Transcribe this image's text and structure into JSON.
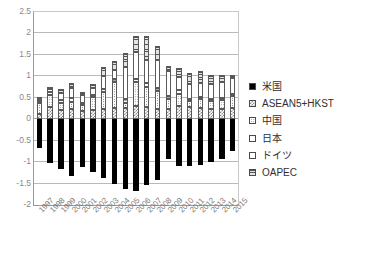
{
  "chart_data": {
    "type": "bar",
    "stacked": true,
    "title": "",
    "xlabel": "",
    "ylabel": "",
    "ylim": [
      -2.0,
      2.5
    ],
    "ytick_values": [
      2.5,
      2,
      1.5,
      1,
      0.5,
      0,
      -0.5,
      -1,
      -1.5,
      -2
    ],
    "ytick_labels": [
      "2.5",
      "2",
      "1.5",
      "1",
      "0.5",
      "0",
      "-0.5",
      "-1",
      "-1.5",
      "-2"
    ],
    "grid": true,
    "legend_position": "right",
    "categories": [
      "1997",
      "1998",
      "1999",
      "2000",
      "2001",
      "2002",
      "2003",
      "2004",
      "2005",
      "2006",
      "2007",
      "2008",
      "2009",
      "2010",
      "2011",
      "2012",
      "2013",
      "2014",
      "2015"
    ],
    "series": [
      {
        "name": "米国",
        "key": "beikoku",
        "fill": "solid-black",
        "color": "#000000",
        "values": [
          -0.68,
          -1.02,
          -1.16,
          -1.33,
          -1.12,
          -1.22,
          -1.36,
          -1.52,
          -1.63,
          -1.68,
          -1.54,
          -1.42,
          -0.93,
          -1.09,
          -1.08,
          -1.06,
          -1.0,
          -0.93,
          -0.74
        ]
      },
      {
        "name": "ASEAN5+HKST",
        "key": "asean",
        "fill": "checker",
        "color": "#8d8d8d",
        "values": [
          0.13,
          0.28,
          0.21,
          0.23,
          0.19,
          0.22,
          0.24,
          0.26,
          0.27,
          0.3,
          0.29,
          0.24,
          0.25,
          0.31,
          0.28,
          0.26,
          0.24,
          0.25,
          0.26
        ]
      },
      {
        "name": "中国",
        "key": "chugoku",
        "fill": "dots",
        "color": "#6f6f6f",
        "values": [
          0.3,
          0.29,
          0.17,
          0.17,
          0.15,
          0.29,
          0.39,
          0.6,
          0.12,
          0.56,
          0.46,
          0.42,
          0.22,
          0.28,
          0.15,
          0.21,
          0.18,
          0.21,
          0.29
        ]
      },
      {
        "name": "日本",
        "key": "nihon",
        "fill": "grid",
        "color": "#a6a6a6",
        "values": [
          0.05,
          0.07,
          0.08,
          0.09,
          0.05,
          0.06,
          0.08,
          0.09,
          0.08,
          0.09,
          0.09,
          0.08,
          0.07,
          0.09,
          0.04,
          0.03,
          0.04,
          0.03,
          0.03
        ]
      },
      {
        "name": "ドイツ",
        "key": "doitsu",
        "fill": "white",
        "color": "#ffffff",
        "values": [
          0.04,
          0.06,
          0.16,
          0.23,
          0.17,
          0.17,
          0.3,
          0.2,
          0.74,
          0.61,
          0.55,
          0.64,
          0.59,
          0.3,
          0.35,
          0.35,
          0.35,
          0.38,
          0.37
        ]
      },
      {
        "name": "OAPEC",
        "key": "oapec",
        "fill": "h-lines",
        "color": "#555555",
        "values": [
          0.0,
          0.05,
          0.09,
          0.13,
          0.07,
          0.08,
          0.22,
          0.2,
          0.34,
          0.38,
          0.54,
          0.33,
          0.11,
          0.22,
          0.26,
          0.28,
          0.22,
          0.17,
          0.09
        ]
      }
    ]
  },
  "legend": {
    "items": [
      {
        "label": "米国"
      },
      {
        "label": "ASEAN5+HKST"
      },
      {
        "label": "中国"
      },
      {
        "label": "日本"
      },
      {
        "label": "ドイツ"
      },
      {
        "label": "OAPEC"
      }
    ]
  }
}
